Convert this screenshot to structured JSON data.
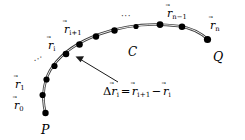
{
  "figure": {
    "background_color": "#ffffff",
    "stroke_color": "#1a1a1a",
    "point_color": "#000000"
  },
  "endpoints": {
    "start_label": "P",
    "end_label": "Q"
  },
  "curve": {
    "name_label": "C"
  },
  "vector_labels": {
    "r0": {
      "symbol": "r",
      "accent": "⃗",
      "subscript": "0"
    },
    "r1": {
      "symbol": "r",
      "accent": "⃗",
      "subscript": "1"
    },
    "ri": {
      "symbol": "r",
      "accent": "⃗",
      "subscript": "i"
    },
    "ri1": {
      "symbol": "r",
      "accent": "⃗",
      "subscript": "i+1"
    },
    "rn1": {
      "symbol": "r",
      "accent": "⃗",
      "subscript": "n−1"
    },
    "rn": {
      "symbol": "r",
      "accent": "⃗",
      "subscript": "n"
    }
  },
  "ellipses": {
    "lower_left": "···",
    "upper_middle": "···"
  },
  "formula": {
    "delta": "Δ",
    "lhs_symbol": "r",
    "lhs_accent": "⃗",
    "lhs_subscript": "i",
    "equals": "=",
    "term1_symbol": "r",
    "term1_accent": "⃗",
    "term1_subscript": "i+1",
    "minus": "−",
    "term2_symbol": "r",
    "term2_accent": "⃗",
    "term2_subscript": "i",
    "plain_text": "Δr⃗i = r⃗i+1 − r⃗i"
  },
  "annotation": {
    "pointer_name": "leader-arrow-to-curve"
  },
  "points_on_curve": [
    {
      "id": "p0",
      "x": 46,
      "y": 112
    },
    {
      "id": "p1",
      "x": 43.5,
      "y": 95
    },
    {
      "id": "p2",
      "x": 47,
      "y": 80
    },
    {
      "id": "p3",
      "x": 54,
      "y": 67
    },
    {
      "id": "p4",
      "x": 66,
      "y": 54
    },
    {
      "id": "p5",
      "x": 80,
      "y": 44
    },
    {
      "id": "p6",
      "x": 96,
      "y": 36
    },
    {
      "id": "p7",
      "x": 114,
      "y": 30
    },
    {
      "id": "p8",
      "x": 135,
      "y": 26
    },
    {
      "id": "p9",
      "x": 160,
      "y": 25
    },
    {
      "id": "p10",
      "x": 182,
      "y": 28
    },
    {
      "id": "p11",
      "x": 207,
      "y": 39
    }
  ]
}
